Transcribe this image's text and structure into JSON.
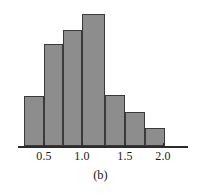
{
  "figure": {
    "caption": "(b)",
    "colors": {
      "bar_fill": "#8d8d8d",
      "bar_stroke": "#3a3a3a",
      "axis": "#2b2b2b",
      "text": "#1a1a1a",
      "background": "#ffffff"
    }
  },
  "axis": {
    "tick_labels": [
      "0.5",
      "1.0",
      "1.5",
      "2.0"
    ],
    "tick_values": [
      0.5,
      1.0,
      1.5,
      2.0
    ]
  },
  "chart_data": {
    "type": "bar",
    "title": "(b)",
    "xlabel": "",
    "ylabel": "",
    "xlim": [
      0.15,
      2.4
    ],
    "ylim": [
      0,
      33
    ],
    "grid": false,
    "legend": null,
    "bin_width": 0.26,
    "bin_edges": [
      0.24,
      0.5,
      0.76,
      1.01,
      1.32,
      1.58,
      1.84,
      2.1
    ],
    "categories": [
      "0.24-0.50",
      "0.50-0.76",
      "0.76-1.01",
      "1.01-1.32",
      "1.32-1.58",
      "1.58-1.84",
      "1.84-2.10"
    ],
    "values": [
      12.5,
      25.5,
      29,
      33,
      12.75,
      8.5,
      4.5
    ],
    "bars_px": [
      {
        "x": 24,
        "width": 20,
        "top": 96,
        "height": 50
      },
      {
        "x": 44,
        "width": 19,
        "top": 44,
        "height": 102
      },
      {
        "x": 63,
        "width": 19,
        "top": 30,
        "height": 116
      },
      {
        "x": 82,
        "width": 23,
        "top": 14,
        "height": 132
      },
      {
        "x": 105,
        "width": 20,
        "top": 95,
        "height": 51
      },
      {
        "x": 125,
        "width": 20,
        "top": 112,
        "height": 34
      },
      {
        "x": 145,
        "width": 20,
        "top": 128,
        "height": 18
      }
    ],
    "axis_px": {
      "x0": 18,
      "x1": 188,
      "y": 146,
      "thickness": 2
    },
    "ticks_px": [
      {
        "x": 44,
        "label": "0.5"
      },
      {
        "x": 82,
        "label": "1.0"
      },
      {
        "x": 125,
        "label": "1.5"
      },
      {
        "x": 163,
        "label": "2.0"
      }
    ],
    "caption_px": {
      "y": 168
    }
  }
}
